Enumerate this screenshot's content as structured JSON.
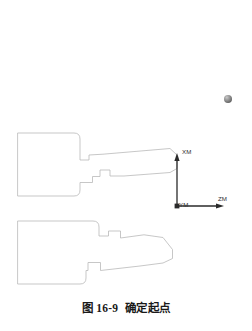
{
  "figure": {
    "caption_number": "图 16-9",
    "caption_title": "确定起点",
    "background_color": "#ffffff",
    "outline_color": "#b9b9b9",
    "axis_color": "#2a2a2a",
    "marker_color": "#808080"
  },
  "axes": {
    "origin_label": "YM",
    "vertical_label": "XM",
    "horizontal_label": "ZM",
    "origin": {
      "x": 177,
      "y": 206
    },
    "vertical_tip": {
      "x": 177,
      "y": 155
    },
    "horizontal_tip": {
      "x": 222,
      "y": 206
    }
  },
  "marker": {
    "name": "start-point-marker",
    "x": 228,
    "y": 99,
    "radius": 4
  },
  "shapes": {
    "upper_profile": {
      "name": "upper-part-profile",
      "path": "M 18 133 L 74 133 Q 80 133 80 139 L 80 160 L 89 160 L 89 155 L 102 154 L 170 148 L 177 155 L 177 168 L 170 172 L 122 176 L 110 176 L 110 170 L 100 170 L 100 176 L 92 176 L 92 182 L 80 182 L 80 190 Q 80 196 74 196 L 18 196 Z"
    },
    "lower_profile": {
      "name": "lower-part-profile",
      "path": "M 18 221 L 93 221 Q 99 221 99 227 L 99 236 L 108 236 L 108 231 L 120 231 L 120 238 L 143 235 L 163 237 L 172 249 L 172 258 L 163 263 L 140 266 L 100 270 L 100 262 L 88 262 L 88 270 L 86 270 L 86 278 Q 86 284 80 284 L 18 284 Z"
    }
  }
}
